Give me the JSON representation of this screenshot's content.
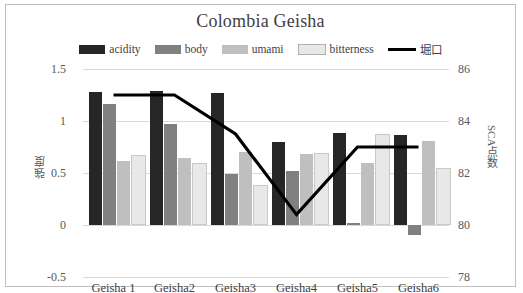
{
  "chart_data": {
    "type": "bar",
    "title": "Colombia Geisha",
    "categories": [
      "Geisha 1",
      "Geisha2",
      "Geisha3",
      "Geisha4",
      "Geisha5",
      "Geisha6"
    ],
    "series": [
      {
        "name": "acidity",
        "color": "#262626",
        "axis": "left",
        "values": [
          1.28,
          1.29,
          1.27,
          0.8,
          0.88,
          0.87
        ]
      },
      {
        "name": "body",
        "color": "#808080",
        "axis": "left",
        "values": [
          1.16,
          0.97,
          0.49,
          0.52,
          0.02,
          -0.1
        ]
      },
      {
        "name": "umami",
        "color": "#bfbfbf",
        "axis": "left",
        "values": [
          0.62,
          0.64,
          0.7,
          0.68,
          0.6,
          0.81
        ]
      },
      {
        "name": "bitterness",
        "color": "#e8e8e8",
        "axis": "left",
        "values": [
          0.65,
          0.58,
          0.37,
          0.67,
          0.86,
          0.53
        ]
      },
      {
        "name": "堀口",
        "color": "#000000",
        "axis": "right",
        "type": "line",
        "values": [
          85.0,
          85.0,
          83.5,
          80.4,
          83.0,
          83.0
        ]
      }
    ],
    "xlabel": "",
    "ylabel": "強度",
    "ylabel_secondary": "SCA点数",
    "ylim": [
      -0.5,
      1.5
    ],
    "yticks": [
      "1.5",
      "1",
      "0.5",
      "0",
      "-0.5"
    ],
    "ylim_secondary": [
      78,
      86
    ],
    "yticks_secondary": [
      "86",
      "84",
      "82",
      "80",
      "78"
    ],
    "grid": true,
    "legend_position": "top"
  },
  "legend": [
    {
      "label": "acidity",
      "swatch": "#262626",
      "kind": "swatch"
    },
    {
      "label": "body",
      "swatch": "#808080",
      "kind": "swatch"
    },
    {
      "label": "umami",
      "swatch": "#bfbfbf",
      "kind": "swatch"
    },
    {
      "label": "bitterness",
      "swatch": "#e8e8e8",
      "kind": "swatch"
    },
    {
      "label": "堀口",
      "swatch": "#000000",
      "kind": "line"
    }
  ]
}
